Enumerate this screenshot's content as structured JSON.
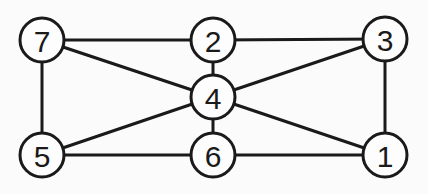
{
  "diagram": {
    "type": "undirected-graph",
    "colors": {
      "stroke": "#1a1a1a",
      "background": "#fbfbfb",
      "node_fill": "#fdfdfd"
    },
    "node_radius": 22,
    "nodes": [
      {
        "id": "7",
        "label": "7",
        "x": 42,
        "y": 40
      },
      {
        "id": "2",
        "label": "2",
        "x": 213,
        "y": 40
      },
      {
        "id": "3",
        "label": "3",
        "x": 385,
        "y": 39
      },
      {
        "id": "4",
        "label": "4",
        "x": 213,
        "y": 97
      },
      {
        "id": "5",
        "label": "5",
        "x": 42,
        "y": 155
      },
      {
        "id": "6",
        "label": "6",
        "x": 213,
        "y": 155
      },
      {
        "id": "1",
        "label": "1",
        "x": 385,
        "y": 155
      }
    ],
    "edges": [
      [
        "7",
        "2"
      ],
      [
        "2",
        "3"
      ],
      [
        "7",
        "4"
      ],
      [
        "2",
        "4"
      ],
      [
        "3",
        "4"
      ],
      [
        "7",
        "5"
      ],
      [
        "3",
        "1"
      ],
      [
        "4",
        "5"
      ],
      [
        "4",
        "6"
      ],
      [
        "4",
        "1"
      ],
      [
        "5",
        "6"
      ],
      [
        "6",
        "1"
      ]
    ]
  }
}
